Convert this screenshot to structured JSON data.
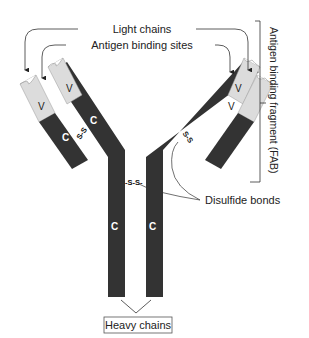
{
  "diagram": {
    "colors": {
      "heavy_chain": "#333333",
      "light_region": "#dcdcdc",
      "line": "#333333",
      "text": "#222222"
    },
    "labels": {
      "light_chains": "Light chains",
      "antigen_binding_sites": "Antigen binding sites",
      "fab": "Antigen binding fragment (FAB)",
      "disulfide_bonds": "Disulfide bonds",
      "heavy_chains": "Heavy chains"
    },
    "segments": {
      "variable": "V",
      "constant": "C"
    },
    "bonds": {
      "left_arm": "S-S",
      "right_arm": "S-S",
      "hinge": "-S-S-"
    }
  }
}
